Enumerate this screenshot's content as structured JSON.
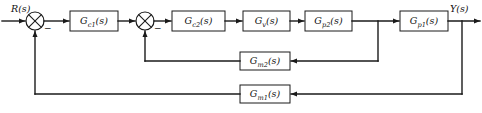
{
  "diagram": {
    "line_color": "#1a1a1a",
    "background_color": "#ffffff",
    "signals": {
      "input_label": "R(s)",
      "output_label": "Y(s)"
    },
    "summing_junctions": [
      {
        "name": "summer-1",
        "sign_label": "−"
      },
      {
        "name": "summer-2",
        "sign_label": "−"
      }
    ],
    "forward_blocks": [
      {
        "name": "Gc1",
        "base": "G",
        "sub": "c1",
        "arg": "(s)"
      },
      {
        "name": "Gc2",
        "base": "G",
        "sub": "c2",
        "arg": "(s)"
      },
      {
        "name": "Gv",
        "base": "G",
        "sub": "v",
        "arg": "(s)"
      },
      {
        "name": "Gp2",
        "base": "G",
        "sub": "p2",
        "arg": "(s)"
      },
      {
        "name": "Gp1",
        "base": "G",
        "sub": "p1",
        "arg": "(s)"
      }
    ],
    "feedback_blocks": [
      {
        "name": "Gm2",
        "base": "G",
        "sub": "m2",
        "arg": "(s)"
      },
      {
        "name": "Gm1",
        "base": "G",
        "sub": "m1",
        "arg": "(s)"
      }
    ]
  }
}
